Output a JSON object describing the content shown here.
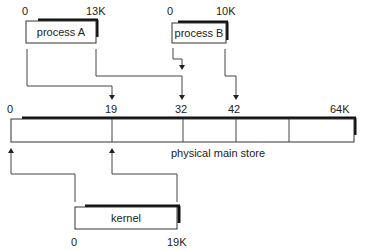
{
  "diagram": {
    "process_a": {
      "label": "process A",
      "start": "0",
      "end": "13K"
    },
    "process_b": {
      "label": "process B",
      "start": "0",
      "end": "10K"
    },
    "kernel": {
      "label": "kernel",
      "start": "0",
      "end": "19K"
    },
    "store": {
      "label": "physical main store",
      "ticks": [
        "0",
        "19",
        "32",
        "42",
        "64K"
      ]
    }
  }
}
